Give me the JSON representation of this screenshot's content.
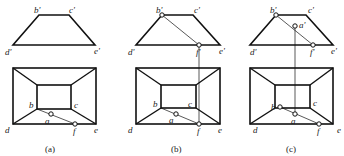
{
  "diagram": {
    "type": "orthographic projection of frustum (front view and top view)",
    "panels": [
      {
        "caption": "(a)",
        "front_view": {
          "labels": {
            "b": "b'",
            "c": "c'",
            "d": "d'",
            "e": "e'"
          },
          "points": {
            "b": [
              39,
              15
            ],
            "c": [
              69,
              15
            ],
            "d": [
              13,
              45
            ],
            "e": [
              95,
              45
            ]
          }
        },
        "top_view": {
          "outer": [
            13,
            68,
            96,
            124
          ],
          "inner": [
            37,
            85,
            71,
            109
          ],
          "labels": {
            "b": "b",
            "c": "c",
            "d": "d",
            "e": "e",
            "a": "a",
            "f": "f"
          },
          "line_bf": [
            [
              37,
              109
            ],
            [
              75,
              124
            ]
          ],
          "point_a": [
            51,
            114
          ],
          "point_f": [
            75,
            124
          ]
        }
      },
      {
        "caption": "(b)",
        "front_view": {
          "labels": {
            "b": "b'",
            "c": "c'",
            "d": "d'",
            "e": "e'",
            "f": "f'"
          },
          "points": {
            "b": [
              162,
              15
            ],
            "c": [
              193,
              15
            ],
            "d": [
              136,
              45
            ],
            "e": [
              220,
              45
            ],
            "f": [
              199,
              45
            ]
          }
        },
        "top_view": {
          "outer": [
            136,
            68,
            220,
            124
          ],
          "inner": [
            161,
            85,
            196,
            108
          ],
          "labels": {
            "b": "b",
            "c": "c",
            "d": "d",
            "e": "e",
            "a": "a",
            "f": "f"
          },
          "point_a": [
            176,
            114
          ],
          "point_f": [
            199,
            124
          ]
        }
      },
      {
        "caption": "(c)",
        "front_view": {
          "labels": {
            "b": "b'",
            "c": "c'",
            "d": "d'",
            "e": "e'",
            "a": "a'",
            "f": "f'"
          },
          "points": {
            "b": [
              276,
              15
            ],
            "c": [
              306,
              15
            ],
            "d": [
              250,
              45
            ],
            "e": [
              333,
              45
            ],
            "a": [
              295,
              26
            ],
            "f": [
              313,
              45
            ]
          }
        },
        "top_view": {
          "outer": [
            250,
            68,
            333,
            124
          ],
          "inner": [
            275,
            85,
            310,
            108
          ],
          "labels": {
            "b": "b",
            "c": "c",
            "d": "d",
            "e": "e",
            "a": "a",
            "f": "f"
          },
          "point_b": [
            280,
            107
          ],
          "point_a": [
            295,
            114
          ],
          "point_f": [
            319,
            124
          ]
        }
      }
    ]
  }
}
